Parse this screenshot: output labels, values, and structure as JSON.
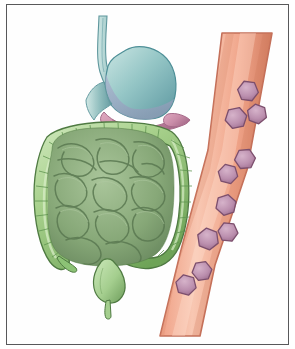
{
  "figure": {
    "caption": "Medical illustration showing the abdominal digestive organs on the left and a cross-section of a blood vessel carrying cells on the right.",
    "canvas": {
      "width": 295,
      "height": 349,
      "background": "#ffffff"
    },
    "frame": {
      "label": "Illustration frame border",
      "stroke": "#58585a",
      "stroke_width": 1,
      "x": 6,
      "y": 4,
      "width": 283,
      "height": 341,
      "fill": "#fefefe"
    }
  },
  "palette": {
    "paper_white": "#ffffff",
    "frame_gray": "#58585a",
    "stomach_teal": "#8fc4c4",
    "stomach_teal_dark": "#4e8f97",
    "stomach_teal_light": "#c5e2e0",
    "stomach_shadow": "#a8a9c4",
    "esophagus_teal": "#7fb6b8",
    "pancreas_pink": "#c98ca8",
    "pancreas_pink_light": "#dfa9c0",
    "pancreas_pink_dark": "#a76b8a",
    "colon_green_light": "#b9dba0",
    "colon_green_mid": "#8cc275",
    "colon_green_dark": "#5f9450",
    "colon_outline": "#4f7a42",
    "small_intestine_green": "#86a878",
    "small_intestine_dark": "#5e7d55",
    "small_intestine_light": "#a8c49a",
    "bladder_green": "#a9d193",
    "vessel_coral": "#ef9e83",
    "vessel_coral_light": "#f6c0ab",
    "vessel_coral_dark": "#d9795c",
    "vessel_outline": "#c4705a",
    "cell_mauve": "#bb8fae",
    "cell_mauve_light": "#d0abc3",
    "cell_outline": "#7c4f6d"
  },
  "organs": [
    {
      "id": "esophagus",
      "name": "Esophagus",
      "description": "Narrow teal tube descending from the top of the illustration into the stomach",
      "color": "#7fb6b8"
    },
    {
      "id": "stomach",
      "name": "Stomach",
      "description": "Large teal J-shaped organ in the upper left region",
      "color": "#8fc4c4"
    },
    {
      "id": "pancreas",
      "name": "Pancreas",
      "description": "Pink lobulated organ lying behind and below the stomach, tail extending to the right",
      "color": "#c98ca8"
    },
    {
      "id": "large-intestine",
      "name": "Large intestine (colon)",
      "description": "Light green haustrated loop framing the small intestine: ascending, transverse, descending and sigmoid colon",
      "color": "#8cc275"
    },
    {
      "id": "small-intestine",
      "name": "Small intestine",
      "description": "Darker sage green coiled loops filling the centre of the colon frame",
      "color": "#86a878"
    },
    {
      "id": "rectum-bladder",
      "name": "Rectum and bladder",
      "description": "Light green rounded structure at the bottom centre below the colon",
      "color": "#a9d193"
    },
    {
      "id": "appendix",
      "name": "Appendix",
      "description": "Small thin green projection at the lower left of the colon",
      "color": "#7fae68"
    }
  ],
  "blood_vessel": {
    "name": "Blood vessel",
    "description": "Diagonal coral-colored vessel running from the upper right to the lower left of the illustration",
    "wall_color": "#ef9e83",
    "outline_color": "#c4705a",
    "cell_count": 10,
    "cell_shape": "hexagon",
    "cell_name": "Blood cell",
    "cells": [
      {
        "id": "cell-1",
        "cx": 248,
        "cy": 91,
        "r": 10.5,
        "rotation": 8
      },
      {
        "id": "cell-2",
        "cx": 236,
        "cy": 118,
        "r": 11.0,
        "rotation": -12
      },
      {
        "id": "cell-3",
        "cx": 257,
        "cy": 114,
        "r": 10.0,
        "rotation": 20
      },
      {
        "id": "cell-4",
        "cx": 245,
        "cy": 159,
        "r": 10.5,
        "rotation": -5
      },
      {
        "id": "cell-5",
        "cx": 228,
        "cy": 174,
        "r": 10.0,
        "rotation": 14
      },
      {
        "id": "cell-6",
        "cx": 226,
        "cy": 205,
        "r": 10.5,
        "rotation": -18
      },
      {
        "id": "cell-7",
        "cx": 228,
        "cy": 232,
        "r": 10.0,
        "rotation": 6
      },
      {
        "id": "cell-8",
        "cx": 208,
        "cy": 239,
        "r": 11.0,
        "rotation": 22
      },
      {
        "id": "cell-9",
        "cx": 202,
        "cy": 271,
        "r": 10.0,
        "rotation": -9
      },
      {
        "id": "cell-10",
        "cx": 186,
        "cy": 285,
        "r": 10.5,
        "rotation": 16
      }
    ]
  }
}
